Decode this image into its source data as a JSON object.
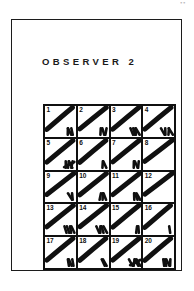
{
  "document": {
    "title": "OBSERVER 2",
    "scan_artifact": "••",
    "ink_color": "#101010",
    "page_color": "#ffffff"
  },
  "grid": {
    "columns": 4,
    "rows": 5,
    "cell_count": 20,
    "cells": [
      {
        "number": "1",
        "tally_count": 3,
        "has_crossed_group": false,
        "diagonal": true
      },
      {
        "number": "2",
        "tally_count": 3,
        "has_crossed_group": false,
        "diagonal": true
      },
      {
        "number": "3",
        "tally_count": 4,
        "has_crossed_group": false,
        "diagonal": true
      },
      {
        "number": "4",
        "tally_count": 4,
        "has_crossed_group": false,
        "diagonal": true
      },
      {
        "number": "5",
        "tally_count": 5,
        "has_crossed_group": true,
        "diagonal": true
      },
      {
        "number": "6",
        "tally_count": 2,
        "has_crossed_group": false,
        "diagonal": true
      },
      {
        "number": "7",
        "tally_count": 3,
        "has_crossed_group": false,
        "diagonal": true
      },
      {
        "number": "8",
        "tally_count": 0,
        "has_crossed_group": false,
        "diagonal": true
      },
      {
        "number": "9",
        "tally_count": 2,
        "has_crossed_group": false,
        "diagonal": true
      },
      {
        "number": "10",
        "tally_count": 3,
        "has_crossed_group": false,
        "diagonal": true
      },
      {
        "number": "11",
        "tally_count": 3,
        "has_crossed_group": false,
        "diagonal": true
      },
      {
        "number": "12",
        "tally_count": 0,
        "has_crossed_group": false,
        "diagonal": true
      },
      {
        "number": "13",
        "tally_count": 4,
        "has_crossed_group": false,
        "diagonal": true
      },
      {
        "number": "14",
        "tally_count": 4,
        "has_crossed_group": false,
        "diagonal": true
      },
      {
        "number": "15",
        "tally_count": 2,
        "has_crossed_group": false,
        "diagonal": true
      },
      {
        "number": "16",
        "tally_count": 1,
        "has_crossed_group": false,
        "diagonal": true
      },
      {
        "number": "17",
        "tally_count": 3,
        "has_crossed_group": false,
        "diagonal": true
      },
      {
        "number": "18",
        "tally_count": 2,
        "has_crossed_group": false,
        "diagonal": true
      },
      {
        "number": "19",
        "tally_count": 5,
        "has_crossed_group": true,
        "diagonal": true
      },
      {
        "number": "20",
        "tally_count": 4,
        "has_crossed_group": false,
        "diagonal": true
      }
    ]
  }
}
